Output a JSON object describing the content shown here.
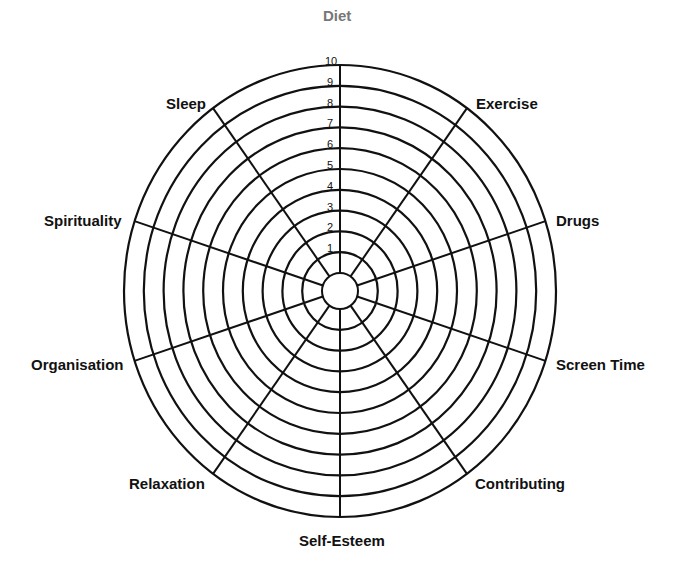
{
  "rings": [
    "1",
    "2",
    "3",
    "4",
    "5",
    "6",
    "7",
    "8",
    "9",
    "10"
  ],
  "categories": [
    {
      "label": "Diet",
      "x": 323,
      "y": 8,
      "top": true
    },
    {
      "label": "Exercise",
      "x": 476,
      "y": 96
    },
    {
      "label": "Drugs",
      "x": 556,
      "y": 213
    },
    {
      "label": "Screen Time",
      "x": 556,
      "y": 357
    },
    {
      "label": "Contributing",
      "x": 475,
      "y": 476
    },
    {
      "label": "Self-Esteem",
      "x": 299,
      "y": 533
    },
    {
      "label": "Relaxation",
      "x": 129,
      "y": 476
    },
    {
      "label": "Organisation",
      "x": 31,
      "y": 357
    },
    {
      "label": "Spirituality",
      "x": 44,
      "y": 213
    },
    {
      "label": "Sleep",
      "x": 166,
      "y": 96
    }
  ],
  "geometry": {
    "cx": 340,
    "cy": 291,
    "rx": 216,
    "ry": 226,
    "inner_r": 18,
    "stroke": "#111111"
  }
}
